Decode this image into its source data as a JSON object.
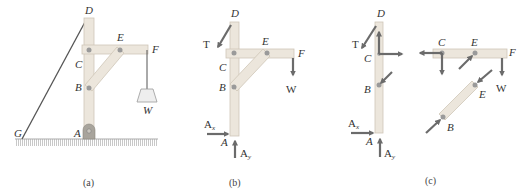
{
  "colors": {
    "member_fill": "#ece6dc",
    "member_stroke": "#cfc6b8",
    "pin": "#9a9a9a",
    "arrow": "#6b6b6b",
    "cable": "#555555",
    "ground": "#bdbdbd",
    "label": "#333333"
  },
  "panels": [
    {
      "id": "a",
      "caption": "(a)",
      "labels": {
        "D": "D",
        "E": "E",
        "F": "F",
        "C": "C",
        "B": "B",
        "W": "W",
        "G": "G",
        "A": "A"
      }
    },
    {
      "id": "b",
      "caption": "(b)",
      "labels": {
        "D": "D",
        "T": "T",
        "E": "E",
        "F": "F",
        "C": "C",
        "B": "B",
        "W": "W",
        "Ax": "A",
        "Ax_sub": "x",
        "A": "A",
        "Ay": "A",
        "Ay_sub": "y"
      }
    },
    {
      "id": "c",
      "caption": "(c)",
      "labels": {
        "D": "D",
        "T": "T",
        "C": "C",
        "B": "B",
        "Ax": "A",
        "Ax_sub": "x",
        "A": "A",
        "Ay": "A",
        "Ay_sub": "y",
        "C2": "C",
        "E": "E",
        "F": "F",
        "W": "W",
        "E2": "E",
        "B2": "B"
      }
    }
  ]
}
